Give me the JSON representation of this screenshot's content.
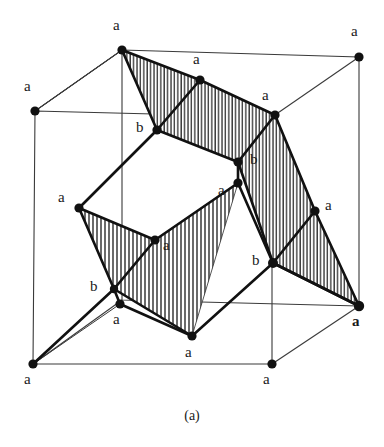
{
  "figure": {
    "caption": "(a)",
    "colors": {
      "ink": "#111111",
      "thin_line": "#4a4a4a",
      "hatch": "#2b2b2b",
      "background": "#ffffff"
    },
    "geometry": {
      "cube_vertices": [
        {
          "id": "cube-top-back-left",
          "x": 122,
          "y": 50
        },
        {
          "id": "cube-top-back-right",
          "x": 359,
          "y": 57
        },
        {
          "id": "cube-top-front-left",
          "x": 35,
          "y": 111
        },
        {
          "id": "cube-top-front-right",
          "x": 272,
          "y": 117
        },
        {
          "id": "cube-bot-back-left",
          "x": 122,
          "y": 300
        },
        {
          "id": "cube-bot-back-right",
          "x": 359,
          "y": 306
        },
        {
          "id": "cube-bot-front-left",
          "x": 33,
          "y": 364
        },
        {
          "id": "cube-bot-front-right",
          "x": 272,
          "y": 364
        }
      ],
      "poly_vertices": [
        {
          "id": "p-top-a",
          "label": "a",
          "x": 200,
          "y": 80
        },
        {
          "id": "p-upper-b-l",
          "label": "b",
          "x": 157,
          "y": 130
        },
        {
          "id": "p-upper-a-r",
          "label": "a",
          "x": 275,
          "y": 115
        },
        {
          "id": "p-mid-b-r",
          "label": "b",
          "x": 238,
          "y": 162
        },
        {
          "id": "p-mid-a-r",
          "label": "a",
          "x": 238,
          "y": 183
        },
        {
          "id": "p-left-a",
          "label": "a",
          "x": 79,
          "y": 208
        },
        {
          "id": "p-right-a",
          "label": "a",
          "x": 315,
          "y": 211
        },
        {
          "id": "p-center-a",
          "label": "a",
          "x": 155,
          "y": 240
        },
        {
          "id": "p-lower-b-l",
          "label": "b",
          "x": 114,
          "y": 289
        },
        {
          "id": "p-lower-a-l",
          "label": "a",
          "x": 120,
          "y": 304
        },
        {
          "id": "p-lower-b-r",
          "label": "b",
          "x": 273,
          "y": 263
        },
        {
          "id": "p-bottom-a",
          "label": "a",
          "x": 192,
          "y": 336
        }
      ]
    },
    "vertex_labels": [
      {
        "name": "label-a-top-left-cube",
        "text": "a",
        "x": 113,
        "y": 18,
        "bold": false
      },
      {
        "name": "label-a-top-right-cube",
        "text": "a",
        "x": 351,
        "y": 24,
        "bold": false
      },
      {
        "name": "label-a-left-cube",
        "text": "a",
        "x": 24,
        "y": 79,
        "bold": false
      },
      {
        "name": "label-a-poly-top",
        "text": "a",
        "x": 193,
        "y": 52,
        "bold": false
      },
      {
        "name": "label-a-poly-upper-right",
        "text": "a",
        "x": 262,
        "y": 88,
        "bold": false
      },
      {
        "name": "label-b-poly-upper-left",
        "text": "b",
        "x": 136,
        "y": 120,
        "bold": false
      },
      {
        "name": "label-b-poly-mid-right",
        "text": "b",
        "x": 250,
        "y": 152,
        "bold": false
      },
      {
        "name": "label-a-poly-mid-right",
        "text": "a",
        "x": 218,
        "y": 183,
        "bold": false
      },
      {
        "name": "label-a-poly-left",
        "text": "a",
        "x": 58,
        "y": 190,
        "bold": false
      },
      {
        "name": "label-a-poly-right",
        "text": "a",
        "x": 325,
        "y": 198,
        "bold": false
      },
      {
        "name": "label-a-poly-center",
        "text": "a",
        "x": 163,
        "y": 238,
        "bold": false
      },
      {
        "name": "label-b-poly-lower-left",
        "text": "b",
        "x": 90,
        "y": 279,
        "bold": false
      },
      {
        "name": "label-b-poly-lower-right",
        "text": "b",
        "x": 252,
        "y": 253,
        "bold": false
      },
      {
        "name": "label-a-lower-left-small",
        "text": "a",
        "x": 113,
        "y": 312,
        "bold": false
      },
      {
        "name": "label-a-right-cube-bold",
        "text": "a",
        "x": 352,
        "y": 314,
        "bold": true
      },
      {
        "name": "label-a-bottom-poly",
        "text": "a",
        "x": 185,
        "y": 345,
        "bold": false
      },
      {
        "name": "label-a-bottom-left-cube",
        "text": "a",
        "x": 24,
        "y": 372,
        "bold": false
      },
      {
        "name": "label-a-bottom-right-cube",
        "text": "a",
        "x": 263,
        "y": 372,
        "bold": false
      }
    ]
  }
}
